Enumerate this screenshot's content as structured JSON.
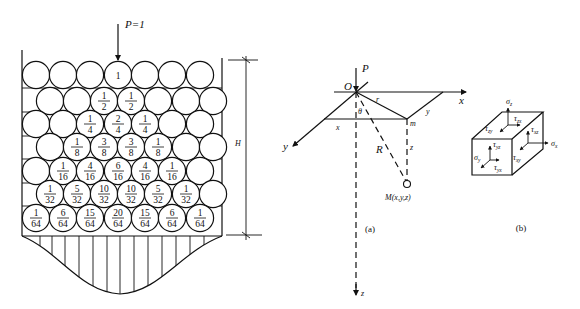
{
  "figure_left": {
    "load_label": "P=1",
    "height_label": "H",
    "container": {
      "left": 22,
      "right": 222,
      "top": 50,
      "bottom": 236
    },
    "circle_radius": 13.6,
    "rows": [
      {
        "y": 75,
        "xs": [
          36,
          63,
          90,
          118,
          145,
          172,
          200
        ],
        "labels": [
          null,
          null,
          null,
          [
            "1"
          ],
          null,
          null,
          null
        ]
      },
      {
        "y": 101,
        "xs": [
          50,
          77,
          104,
          131,
          158,
          186,
          213
        ],
        "labels": [
          null,
          null,
          [
            "1",
            "2"
          ],
          [
            "1",
            "2"
          ],
          null,
          null,
          null
        ]
      },
      {
        "y": 124,
        "xs": [
          36,
          63,
          90,
          118,
          145,
          172,
          200
        ],
        "labels": [
          null,
          null,
          [
            "1",
            "4"
          ],
          [
            "2",
            "4"
          ],
          [
            "1",
            "4"
          ],
          null,
          null
        ]
      },
      {
        "y": 147,
        "xs": [
          50,
          77,
          104,
          131,
          158,
          186,
          213
        ],
        "labels": [
          null,
          [
            "1",
            "8"
          ],
          [
            "3",
            "8"
          ],
          [
            "3",
            "8"
          ],
          [
            "1",
            "8"
          ],
          null,
          null
        ]
      },
      {
        "y": 171,
        "xs": [
          36,
          63,
          90,
          118,
          145,
          172,
          200
        ],
        "labels": [
          null,
          [
            "1",
            "16"
          ],
          [
            "4",
            "16"
          ],
          [
            "6",
            "16"
          ],
          [
            "4",
            "16"
          ],
          [
            "1",
            "16"
          ],
          null
        ]
      },
      {
        "y": 194,
        "xs": [
          50,
          77,
          104,
          131,
          158,
          186,
          213
        ],
        "labels": [
          [
            "1",
            "32"
          ],
          [
            "5",
            "32"
          ],
          [
            "10",
            "32"
          ],
          [
            "10",
            "32"
          ],
          [
            "5",
            "32"
          ],
          [
            "1",
            "32"
          ],
          null
        ]
      },
      {
        "y": 218,
        "xs": [
          36,
          63,
          90,
          118,
          145,
          172,
          200
        ],
        "labels": [
          [
            "1",
            "64"
          ],
          [
            "6",
            "64"
          ],
          [
            "15",
            "64"
          ],
          [
            "20",
            "64"
          ],
          [
            "15",
            "64"
          ],
          [
            "6",
            "64"
          ],
          [
            "1",
            "64"
          ]
        ]
      }
    ],
    "distribution_hatch_xs": [
      40,
      52,
      65,
      79,
      93,
      107,
      120,
      134,
      148,
      162,
      176,
      190,
      204
    ]
  },
  "figure_a": {
    "caption": "(a)",
    "labels": {
      "P": "P",
      "O": "O",
      "x_axis": "x",
      "y_axis": "y",
      "z_axis": "z",
      "r": "r",
      "theta": "θ",
      "R": "R",
      "m": "m",
      "x_seg": "x",
      "y_seg": "y",
      "z_seg": "z",
      "M": "M(x,y,z)"
    }
  },
  "figure_b": {
    "caption": "(b)",
    "stress_labels": {
      "sigma_z": {
        "base": "σ",
        "sub": "z"
      },
      "tau_zx": {
        "base": "τ",
        "sub": "zx"
      },
      "tau_zy": {
        "base": "τ",
        "sub": "zy"
      },
      "tau_xz": {
        "base": "τ",
        "sub": "xz"
      },
      "sigma_x": {
        "base": "σ",
        "sub": "x"
      },
      "tau_xy": {
        "base": "τ",
        "sub": "xy"
      },
      "tau_yz": {
        "base": "τ",
        "sub": "yz"
      },
      "sigma_y": {
        "base": "σ",
        "sub": "y"
      },
      "tau_yx": {
        "base": "τ",
        "sub": "yx"
      }
    }
  }
}
